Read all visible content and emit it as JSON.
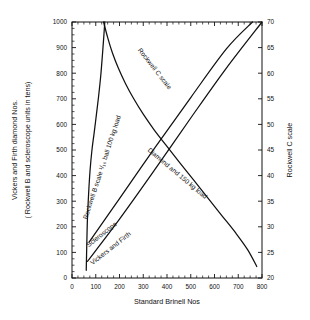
{
  "chart_data": {
    "type": "line",
    "title": "",
    "xlabel": "Standard  Brinell Nos",
    "ylabel_left_line1": "Vickers and Firth diamond Nos.",
    "ylabel_left_line2": "( Rockwell B and scleroscope units in tens)",
    "ylabel_right": "Rockwell C scale",
    "xlim": [
      0,
      800
    ],
    "ylim_left": [
      0,
      1000
    ],
    "ylim_right": [
      70,
      20
    ],
    "grid": false,
    "legend": "inline-curve-labels",
    "xticks": [
      0,
      100,
      200,
      300,
      400,
      500,
      600,
      700,
      800
    ],
    "xticklabels": [
      "0",
      "100",
      "200",
      "300",
      "400",
      "500",
      "600",
      "700",
      "800"
    ],
    "yticks_left": [
      0,
      100,
      200,
      300,
      400,
      500,
      600,
      700,
      800,
      900,
      1000
    ],
    "yticklabels_left": [
      "0",
      "100",
      "200",
      "300",
      "400",
      "500",
      "600",
      "700",
      "800",
      "900",
      "1000"
    ],
    "yticks_right": [
      20,
      25,
      30,
      35,
      40,
      45,
      50,
      55,
      60,
      65,
      70
    ],
    "yticklabels_right": [
      "20",
      "25",
      "30",
      "35",
      "40",
      "45",
      "50",
      "55",
      "60",
      "65",
      "70"
    ],
    "x_minor_step": 25,
    "y_minor_step_left": 25,
    "y_minor_step_right": 2.5,
    "series": [
      {
        "name": "Rockwell B scale 1/16 ball 100 kg load",
        "label": "Rockwell B scale ¹₁₆ ball 100 kg load",
        "label_text": "Rockwell B scale 1/16 ball 100 kg load",
        "axis": "left",
        "points": [
          [
            60,
            30
          ],
          [
            62,
            120
          ],
          [
            65,
            230
          ],
          [
            70,
            330
          ],
          [
            76,
            420
          ],
          [
            84,
            500
          ],
          [
            93,
            565
          ],
          [
            103,
            640
          ],
          [
            112,
            710
          ],
          [
            121,
            790
          ],
          [
            128,
            870
          ],
          [
            134,
            945
          ],
          [
            138,
            1000
          ]
        ]
      },
      {
        "name": "Rockwell C scale",
        "label_text": "Rockwell C scale",
        "axis": "right",
        "points": [
          [
            133,
            1000
          ],
          [
            150,
            940
          ],
          [
            170,
            880
          ],
          [
            195,
            820
          ],
          [
            225,
            760
          ],
          [
            260,
            700
          ],
          [
            300,
            640
          ],
          [
            345,
            580
          ],
          [
            395,
            520
          ],
          [
            450,
            455
          ],
          [
            510,
            385
          ],
          [
            570,
            315
          ],
          [
            630,
            245
          ],
          [
            690,
            175
          ],
          [
            740,
            110
          ],
          [
            778,
            45
          ]
        ]
      },
      {
        "name": "Scleroscope",
        "label_text": "Scleroscope",
        "axis": "left",
        "points": [
          [
            72,
            140
          ],
          [
            200,
            310
          ],
          [
            350,
            510
          ],
          [
            500,
            705
          ],
          [
            650,
            895
          ],
          [
            760,
            1000
          ]
        ]
      },
      {
        "name": "Vickers and Firth",
        "label_text": "Vickers and Firth",
        "axis": "left",
        "points": [
          [
            65,
            65
          ],
          [
            200,
            230
          ],
          [
            350,
            425
          ],
          [
            500,
            625
          ],
          [
            650,
            820
          ],
          [
            800,
            1000
          ]
        ]
      },
      {
        "name": "Diamond and 150 kg load",
        "label_text": "Diamond and 150 kg load",
        "axis": "right",
        "note": "label belongs to the Rockwell C diamond cone curve"
      }
    ],
    "curve_labels": [
      {
        "id": "rockwell-b-label",
        "text": "Rockwell B scale ¹/₁₆ ball 100 kg load",
        "x": 104,
        "y": 168,
        "rotate": -72
      },
      {
        "id": "rockwell-c-label",
        "text": "Rockwell C scale",
        "x": 153,
        "y": 70,
        "rotate": 52
      },
      {
        "id": "scleroscope-label",
        "text": "Scleroscope",
        "x": 103,
        "y": 236,
        "rotate": -38
      },
      {
        "id": "vickers-firth-label",
        "text": "Vickers and Firth",
        "x": 112,
        "y": 250,
        "rotate": -38
      },
      {
        "id": "diamond-load-label",
        "text": "Diamond and 150 kg load",
        "x": 176,
        "y": 175,
        "rotate": 40
      }
    ],
    "colors": {
      "ink": "#111111",
      "background": "#ffffff"
    }
  }
}
